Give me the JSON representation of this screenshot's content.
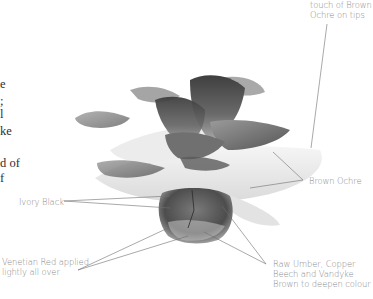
{
  "body_text_fragments": [
    "e",
    ";",
    "l",
    "ke",
    "d of",
    "f"
  ],
  "annotations": {
    "top_right": [
      "touch of Brown",
      "Ochre on tips"
    ],
    "brown_ochre": "Brown Ochre",
    "ivory_black": "Ivory Black",
    "venetian_red": [
      "Venetian Red applied",
      "lightly all over"
    ],
    "raw_umber": [
      "Raw Umber, Copper",
      "Beech and Vandyke",
      "Brown to deepen colour"
    ]
  },
  "illustration": {
    "subject": "plant-rosette-illustration",
    "palette": {
      "leaf_dark": "#4a4a4a",
      "leaf_mid": "#8c8c8c",
      "leaf_light": "#d8d8d8",
      "leader_line": "#6e6e6e",
      "label_text": "#8a8a8a",
      "body_text": "#2e2e2e"
    }
  }
}
